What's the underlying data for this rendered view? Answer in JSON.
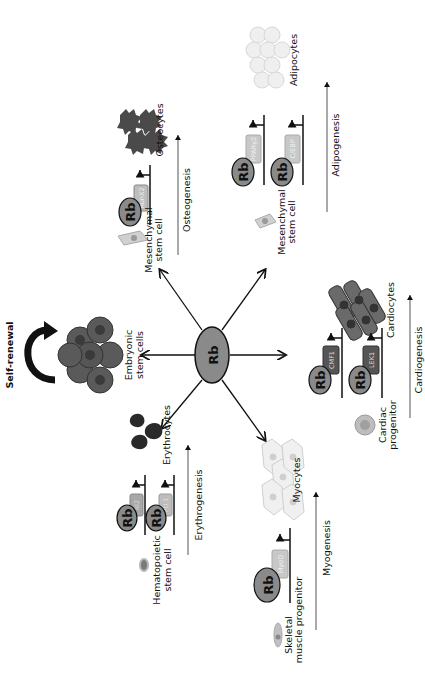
{
  "center": {
    "label": "Rb"
  },
  "branches": {
    "embryonic": {
      "cell_label_1": "Embryonic",
      "cell_label_2": "stem cells",
      "self_renewal": "Self-renewal"
    },
    "osteogenesis": {
      "progenitor_1": "Mesenchymal",
      "progenitor_2": "stem cell",
      "rb": "Rb",
      "factors": [
        "RunX2"
      ],
      "product": "Osteocytes",
      "process": "Osteogenesis"
    },
    "adipogenesis": {
      "progenitor_1": "Mesenchymal",
      "progenitor_2": "stem cell",
      "rb": "Rb",
      "factors": [
        "PPARγ2",
        "C/EBP"
      ],
      "product": "Adipocytes",
      "process": "Adipogenesis"
    },
    "cardiogenesis": {
      "progenitor_1": "Cardiac",
      "progenitor_2": "progenitor",
      "rb": "Rb",
      "factors": [
        "CMF1",
        "LEK1"
      ],
      "product": "Cardiocytes",
      "process": "Cardiogenesis"
    },
    "myogenesis": {
      "progenitor_1": "Skeletal",
      "progenitor_2": "muscle progenitor",
      "rb": "Rb",
      "factors": [
        "MyoD"
      ],
      "product": "Myocytes",
      "process": "Myogenesis"
    },
    "erythrogenesis": {
      "progenitor_1": "Hematopoietic",
      "progenitor_2": "stem cell",
      "rb": "Rb",
      "factors": [
        "Id2",
        "PU.1"
      ],
      "product": "Erythrocytes",
      "process": "Erythrogenesis"
    }
  },
  "colors": {
    "rb_fill": "#8a8a8a",
    "dark_tf": "#555555",
    "light_tf": "#bdbdbd",
    "ink": "#111111"
  }
}
